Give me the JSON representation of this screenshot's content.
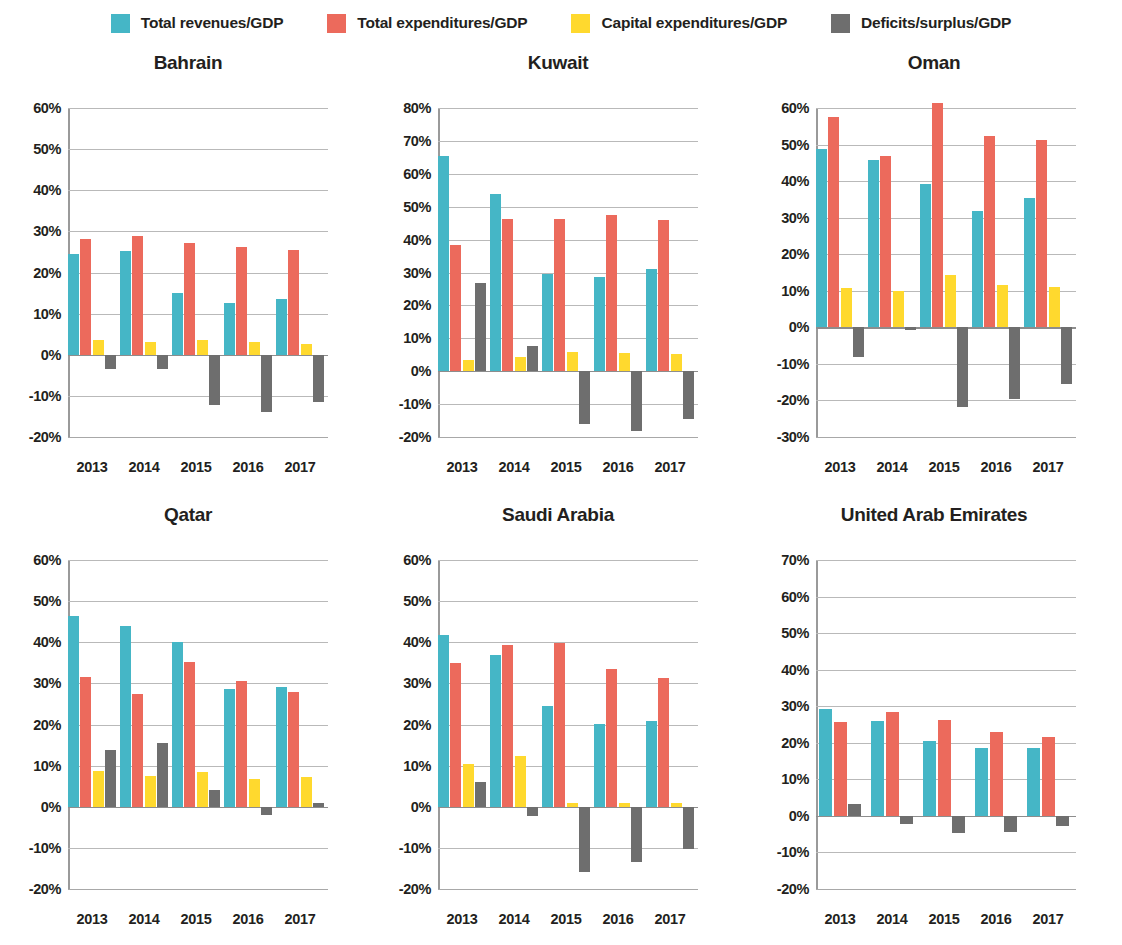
{
  "legend": {
    "items": [
      {
        "label": "Total revenues/GDP",
        "color": "#45b6c6",
        "key": "revenues"
      },
      {
        "label": "Total expenditures/GDP",
        "color": "#ec6a5c",
        "key": "expenditures"
      },
      {
        "label": "Capital expenditures/GDP",
        "color": "#ffd92e",
        "key": "capital"
      },
      {
        "label": "Deficits/surplus/GDP",
        "color": "#6e6e6e",
        "key": "deficit"
      }
    ]
  },
  "chart_data": [
    {
      "type": "bar",
      "title": "Bahrain",
      "xlabel": "",
      "ylabel": "",
      "categories": [
        "2013",
        "2014",
        "2015",
        "2016",
        "2017"
      ],
      "yticks": [
        "60%",
        "50%",
        "40%",
        "30%",
        "20%",
        "10%",
        "0%",
        "-10%",
        "-20%"
      ],
      "ylim": [
        -20,
        60
      ],
      "grid": true,
      "legend_position": "top",
      "series": [
        {
          "name": "Total revenues/GDP",
          "color": "#45b6c6",
          "values": [
            24.5,
            25.3,
            15.0,
            12.7,
            13.6
          ]
        },
        {
          "name": "Total expenditures/GDP",
          "color": "#ec6a5c",
          "values": [
            28.2,
            28.9,
            27.2,
            26.3,
            25.4
          ]
        },
        {
          "name": "Capital expenditures/GDP",
          "color": "#ffd92e",
          "values": [
            3.6,
            3.2,
            3.5,
            3.0,
            2.6
          ]
        },
        {
          "name": "Deficits/surplus/GDP",
          "color": "#6e6e6e",
          "values": [
            -3.4,
            -3.5,
            -12.2,
            -13.8,
            -11.4
          ]
        }
      ]
    },
    {
      "type": "bar",
      "title": "Kuwait",
      "xlabel": "",
      "ylabel": "",
      "categories": [
        "2013",
        "2014",
        "2015",
        "2016",
        "2017"
      ],
      "yticks": [
        "80%",
        "70%",
        "60%",
        "50%",
        "40%",
        "30%",
        "20%",
        "10%",
        "0%",
        "-10%",
        "-20%"
      ],
      "ylim": [
        -20,
        80
      ],
      "grid": true,
      "legend_position": "top",
      "series": [
        {
          "name": "Total revenues/GDP",
          "color": "#45b6c6",
          "values": [
            65.5,
            54.0,
            29.4,
            28.6,
            31.0
          ]
        },
        {
          "name": "Total expenditures/GDP",
          "color": "#ec6a5c",
          "values": [
            38.5,
            46.3,
            46.3,
            47.5,
            46.0
          ]
        },
        {
          "name": "Capital expenditures/GDP",
          "color": "#ffd92e",
          "values": [
            3.5,
            4.2,
            5.8,
            5.6,
            5.2
          ]
        },
        {
          "name": "Deficits/surplus/GDP",
          "color": "#6e6e6e",
          "values": [
            26.8,
            7.7,
            -16.0,
            -18.3,
            -14.5
          ]
        }
      ]
    },
    {
      "type": "bar",
      "title": "Oman",
      "xlabel": "",
      "ylabel": "",
      "categories": [
        "2013",
        "2014",
        "2015",
        "2016",
        "2017"
      ],
      "yticks": [
        "60%",
        "50%",
        "40%",
        "30%",
        "20%",
        "10%",
        "0%",
        "-10%",
        "-20%",
        "-30%"
      ],
      "ylim": [
        -30,
        60
      ],
      "grid": true,
      "legend_position": "top",
      "series": [
        {
          "name": "Total revenues/GDP",
          "color": "#45b6c6",
          "values": [
            48.8,
            45.7,
            39.2,
            31.8,
            35.5
          ]
        },
        {
          "name": "Total expenditures/GDP",
          "color": "#ec6a5c",
          "values": [
            57.6,
            47.0,
            61.5,
            52.4,
            51.3
          ]
        },
        {
          "name": "Capital expenditures/GDP",
          "color": "#ffd92e",
          "values": [
            10.8,
            10.0,
            14.3,
            11.6,
            11.0
          ]
        },
        {
          "name": "Deficits/surplus/GDP",
          "color": "#6e6e6e",
          "values": [
            -8.2,
            -0.7,
            -21.8,
            -19.5,
            -15.5
          ]
        }
      ]
    },
    {
      "type": "bar",
      "title": "Qatar",
      "xlabel": "",
      "ylabel": "",
      "categories": [
        "2013",
        "2014",
        "2015",
        "2016",
        "2017"
      ],
      "yticks": [
        "60%",
        "50%",
        "40%",
        "30%",
        "20%",
        "10%",
        "0%",
        "-10%",
        "-20%"
      ],
      "ylim": [
        -20,
        60
      ],
      "grid": true,
      "legend_position": "top",
      "series": [
        {
          "name": "Total revenues/GDP",
          "color": "#45b6c6",
          "values": [
            46.5,
            44.0,
            40.1,
            28.6,
            29.0
          ]
        },
        {
          "name": "Total expenditures/GDP",
          "color": "#ec6a5c",
          "values": [
            31.6,
            27.3,
            35.2,
            30.6,
            27.9
          ]
        },
        {
          "name": "Capital expenditures/GDP",
          "color": "#ffd92e",
          "values": [
            8.6,
            7.4,
            8.5,
            6.8,
            7.3
          ]
        },
        {
          "name": "Deficits/surplus/GDP",
          "color": "#6e6e6e",
          "values": [
            13.7,
            15.5,
            4.0,
            -2.0,
            0.9
          ]
        }
      ]
    },
    {
      "type": "bar",
      "title": "Saudi Arabia",
      "xlabel": "",
      "ylabel": "",
      "categories": [
        "2013",
        "2014",
        "2015",
        "2016",
        "2017"
      ],
      "yticks": [
        "60%",
        "50%",
        "40%",
        "30%",
        "20%",
        "10%",
        "0%",
        "-10%",
        "-20%"
      ],
      "ylim": [
        -20,
        60
      ],
      "grid": true,
      "legend_position": "top",
      "series": [
        {
          "name": "Total revenues/GDP",
          "color": "#45b6c6",
          "values": [
            41.7,
            37.0,
            24.4,
            20.1,
            20.9
          ]
        },
        {
          "name": "Total expenditures/GDP",
          "color": "#ec6a5c",
          "values": [
            35.0,
            39.4,
            39.9,
            33.6,
            31.3
          ]
        },
        {
          "name": "Capital expenditures/GDP",
          "color": "#ffd92e",
          "values": [
            10.3,
            12.4,
            1.0,
            0.8,
            0.8
          ]
        },
        {
          "name": "Deficits/surplus/GDP",
          "color": "#6e6e6e",
          "values": [
            6.0,
            -2.3,
            -15.8,
            -13.5,
            -10.3
          ]
        }
      ]
    },
    {
      "type": "bar",
      "title": "United Arab Emirates",
      "xlabel": "",
      "ylabel": "",
      "categories": [
        "2013",
        "2014",
        "2015",
        "2016",
        "2017"
      ],
      "yticks": [
        "70%",
        "60%",
        "50%",
        "40%",
        "30%",
        "20%",
        "10%",
        "0%",
        "-10%",
        "-20%"
      ],
      "ylim": [
        -20,
        70
      ],
      "grid": true,
      "legend_position": "top",
      "series": [
        {
          "name": "Total revenues/GDP",
          "color": "#45b6c6",
          "values": [
            29.2,
            25.9,
            20.6,
            18.5,
            18.5
          ]
        },
        {
          "name": "Total expenditures/GDP",
          "color": "#ec6a5c",
          "values": [
            25.7,
            28.4,
            26.1,
            23.0,
            21.5
          ]
        },
        {
          "name": "Capital expenditures/GDP",
          "color": "#ffd92e",
          "values": [
            null,
            null,
            null,
            null,
            null
          ]
        },
        {
          "name": "Deficits/surplus/GDP",
          "color": "#6e6e6e",
          "values": [
            3.3,
            -2.1,
            -4.8,
            -4.3,
            -2.7
          ]
        }
      ]
    }
  ]
}
